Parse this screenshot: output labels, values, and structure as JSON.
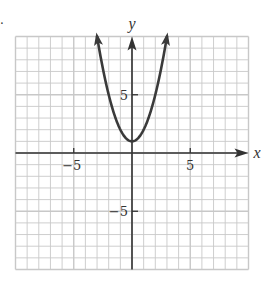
{
  "chart_data": {
    "type": "line",
    "title": "",
    "xlabel": "x",
    "ylabel": "y",
    "xlim": [
      -10,
      10
    ],
    "ylim": [
      -10,
      10
    ],
    "grid": true,
    "grid_step": 1,
    "x_ticks": [
      {
        "value": -5,
        "label": "−5"
      },
      {
        "value": 5,
        "label": "5"
      }
    ],
    "y_ticks": [
      {
        "value": 5,
        "label": "5"
      },
      {
        "value": -5,
        "label": "−5"
      }
    ],
    "series": [
      {
        "name": "y = x^2 + 1",
        "equation": "y = x^2 + 1",
        "vertex": [
          0,
          1
        ],
        "x_range": [
          -3,
          3
        ],
        "arrows_at_ends": true,
        "x": [
          -3,
          -2.5,
          -2,
          -1.5,
          -1,
          -0.5,
          0,
          0.5,
          1,
          1.5,
          2,
          2.5,
          3
        ],
        "y": [
          10,
          7.25,
          5,
          3.25,
          2,
          1.25,
          1,
          1.25,
          2,
          3.25,
          5,
          7.25,
          10
        ],
        "color": "#3a3a3a"
      }
    ],
    "colors": {
      "grid": "#c8c8c8",
      "axis": "#333333",
      "curve": "#3a3a3a",
      "background": "#ffffff"
    }
  },
  "labels": {
    "x_axis": "x",
    "y_axis": "y",
    "tick_x_neg5": "−5",
    "tick_x_pos5": "5",
    "tick_y_pos5": "5",
    "tick_y_neg5": "−5",
    "problem_marker": "."
  }
}
